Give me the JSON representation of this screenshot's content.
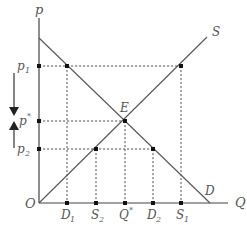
{
  "diagram": {
    "type": "supply-demand",
    "axes": {
      "y_label": "p",
      "x_label": "Q",
      "origin_label": "O"
    },
    "curves": [
      {
        "name": "supply",
        "label": "S"
      },
      {
        "name": "demand",
        "label": "D"
      }
    ],
    "equilibrium": {
      "label": "E"
    },
    "price_levels": [
      {
        "id": "p1",
        "label": "p",
        "sub": "1"
      },
      {
        "id": "pstar",
        "label": "p",
        "sup": "*"
      },
      {
        "id": "p2",
        "label": "p",
        "sub": "2"
      }
    ],
    "quantity_ticks": [
      {
        "id": "D1",
        "label": "D",
        "sub": "1"
      },
      {
        "id": "S2",
        "label": "S",
        "sub": "2"
      },
      {
        "id": "Qstar",
        "label": "Q",
        "sup": "*"
      },
      {
        "id": "D2",
        "label": "D",
        "sub": "2"
      },
      {
        "id": "S1",
        "label": "S",
        "sub": "1"
      }
    ],
    "arrows": [
      {
        "id": "down-arrow",
        "direction": "down"
      },
      {
        "id": "up-arrow",
        "direction": "up"
      }
    ]
  },
  "colors": {
    "line": "#555555",
    "axis": "#444444",
    "dot": "#111111",
    "text": "#555555",
    "background": "#ffffff"
  }
}
